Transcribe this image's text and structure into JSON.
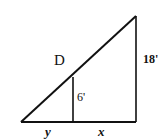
{
  "diagram": {
    "type": "similar-triangles",
    "labels": {
      "point": "D",
      "small_height": "6'",
      "large_height": "18'",
      "left_base": "y",
      "right_base": "x"
    },
    "colors": {
      "line": "#111111",
      "background": "#ffffff"
    }
  }
}
